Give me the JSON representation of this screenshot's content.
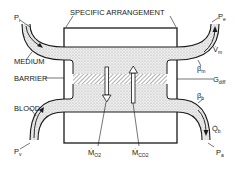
{
  "diagram": {
    "title": "SPECIFIC ARRANGEMENT",
    "labels": {
      "medium": "MEDIUM",
      "barrier": "BARRIER",
      "blood": "BLOOD",
      "p_i": "P",
      "p_i_sub": "i",
      "p_e": "P",
      "p_e_sub": "e",
      "p_v": "P",
      "p_v_sub": "v",
      "p_a": "P",
      "p_a_sub": "a",
      "v_m": "V̇",
      "v_m_sub": "m",
      "beta_m": "β",
      "beta_m_sub": "m",
      "g_diff": "G",
      "g_diff_sub": "diff",
      "beta_b": "β",
      "beta_b_sub": "b",
      "q_b": "Q̇",
      "q_b_sub": "b",
      "m_o2": "Ṁ",
      "m_o2_sub": "O2",
      "m_co2": "Ṁ",
      "m_co2_sub": "CO2"
    },
    "colors": {
      "line": "#1a1a1a",
      "stipple": "#d8d8d8",
      "background": "#ffffff"
    }
  }
}
